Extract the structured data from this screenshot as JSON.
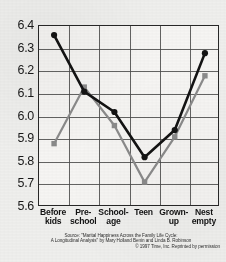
{
  "chart_data": {
    "type": "line",
    "title": "",
    "xlabel": "",
    "ylabel": "",
    "ylim": [
      5.6,
      6.4
    ],
    "ytick_step": 0.1,
    "grid": true,
    "legend": "none",
    "categories": [
      "Before kids",
      "Pre-school",
      "School-age",
      "Teen",
      "Grown-up",
      "Nest empty"
    ],
    "ytick_labels": [
      "6.4",
      "6.3",
      "6.2",
      "6.1",
      "6.0",
      "5.9",
      "5.8",
      "5.7",
      "5.6"
    ],
    "series": [
      {
        "name": "black-series",
        "color": "#151515",
        "marker": "circle",
        "values": [
          6.36,
          6.11,
          6.02,
          5.82,
          5.94,
          6.28
        ]
      },
      {
        "name": "gray-series",
        "color": "#8b8b8b",
        "marker": "square",
        "values": [
          5.88,
          6.13,
          5.96,
          5.71,
          5.91,
          6.18
        ]
      }
    ]
  },
  "xaxis": {
    "labels": [
      {
        "line1": "Before",
        "line2": "kids"
      },
      {
        "line1": "Pre-",
        "line2": "school"
      },
      {
        "line1": "School-",
        "line2": "age"
      },
      {
        "line1": "Teen",
        "line2": ""
      },
      {
        "line1": "Grown-",
        "line2": "up"
      },
      {
        "line1": "Nest",
        "line2": "empty"
      }
    ]
  },
  "source": {
    "line1": "Source: \"Marital Happiness Across the Family Life Cycle:",
    "line2": "A Longitudinal Analysis\" by Mary Holland Benin and Linda B. Robinson",
    "line3": "© 1997 Time, Inc. Reprinted by permission"
  },
  "colors": {
    "black_series": "#151515",
    "gray_series": "#8b8b8b",
    "grid": "#4a4a4a",
    "plot_bg": "#f4f3f1",
    "page_bg": "#efefed"
  }
}
